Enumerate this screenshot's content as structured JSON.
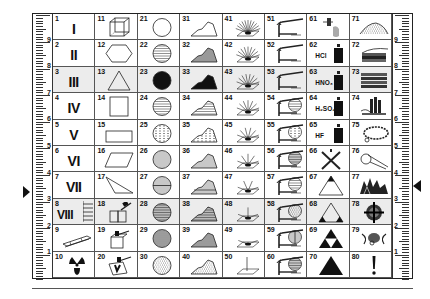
{
  "ruler": {
    "labels": [
      "9",
      "8",
      "7",
      "6",
      "5",
      "4",
      "3",
      "2",
      "1"
    ]
  },
  "cells": [
    {
      "n": "1",
      "roman": "I",
      "icon": "roman-numeral"
    },
    {
      "n": "2",
      "roman": "II",
      "icon": "roman-numeral"
    },
    {
      "n": "3",
      "roman": "III",
      "icon": "roman-numeral",
      "shade": true
    },
    {
      "n": "4",
      "roman": "IV",
      "icon": "roman-numeral"
    },
    {
      "n": "5",
      "roman": "V",
      "icon": "roman-numeral"
    },
    {
      "n": "6",
      "roman": "VI",
      "icon": "roman-numeral"
    },
    {
      "n": "7",
      "roman": "VII",
      "icon": "roman-numeral"
    },
    {
      "n": "8",
      "roman": "VIII",
      "icon": "roman-numeral-lines",
      "shade": true
    },
    {
      "n": "9",
      "icon": "ruler-bar-icon"
    },
    {
      "n": "10",
      "icon": "radiation-icon"
    },
    {
      "n": "11",
      "icon": "cube-icon"
    },
    {
      "n": "12",
      "icon": "hexagon-icon"
    },
    {
      "n": "13",
      "icon": "triangle-outline-icon",
      "shade": true
    },
    {
      "n": "14",
      "icon": "square-icon"
    },
    {
      "n": "15",
      "icon": "rectangle-icon"
    },
    {
      "n": "16",
      "icon": "parallelogram-icon"
    },
    {
      "n": "17",
      "icon": "scalene-triangle-icon"
    },
    {
      "n": "18",
      "icon": "hammer-block-icon",
      "shade": true
    },
    {
      "n": "19",
      "icon": "hammer-box-icon"
    },
    {
      "n": "20",
      "icon": "hammer-broken-box-icon"
    },
    {
      "n": "21",
      "icon": "circle-empty-icon"
    },
    {
      "n": "22",
      "icon": "circle-hlines-icon"
    },
    {
      "n": "23",
      "icon": "circle-filled-icon",
      "shade": true
    },
    {
      "n": "24",
      "icon": "circle-hlines-sparse-icon"
    },
    {
      "n": "25",
      "icon": "circle-dashed-icon"
    },
    {
      "n": "26",
      "icon": "circle-vlines-icon"
    },
    {
      "n": "27",
      "icon": "circle-vlines-split-icon"
    },
    {
      "n": "28",
      "icon": "circle-crosshatch-icon",
      "shade": true
    },
    {
      "n": "29",
      "icon": "circle-hlines-bold-icon"
    },
    {
      "n": "30",
      "icon": "circle-stipple-icon"
    },
    {
      "n": "31",
      "icon": "mountain-outline-icon"
    },
    {
      "n": "32",
      "icon": "mountain-gray-icon"
    },
    {
      "n": "33",
      "icon": "mountain-filled-icon",
      "shade": true
    },
    {
      "n": "34",
      "icon": "mountain-hlines-icon"
    },
    {
      "n": "35",
      "icon": "mountain-dashed-icon"
    },
    {
      "n": "36",
      "icon": "mountain-vlines-icon"
    },
    {
      "n": "37",
      "icon": "mountain-vlines-split-icon"
    },
    {
      "n": "38",
      "icon": "mountain-crosshatch-icon",
      "shade": true
    },
    {
      "n": "39",
      "icon": "mountain-hlines-bold-icon"
    },
    {
      "n": "40",
      "icon": "mountain-stipple-icon"
    },
    {
      "n": "41",
      "icon": "fan-rays-11-icon"
    },
    {
      "n": "42",
      "icon": "fan-rays-9-icon"
    },
    {
      "n": "43",
      "icon": "fan-rays-8-icon",
      "shade": true
    },
    {
      "n": "44",
      "icon": "fan-rays-7-icon"
    },
    {
      "n": "45",
      "icon": "fan-rays-6-icon"
    },
    {
      "n": "46",
      "icon": "fan-rays-5-icon"
    },
    {
      "n": "47",
      "icon": "fan-rays-4-icon"
    },
    {
      "n": "48",
      "icon": "fan-rays-3-icon",
      "shade": true
    },
    {
      "n": "49",
      "icon": "fan-rays-2-icon"
    },
    {
      "n": "50",
      "icon": "fan-rays-1-icon"
    },
    {
      "n": "51",
      "icon": "tap-pipe-icon"
    },
    {
      "n": "52",
      "icon": "tap-pipe-icon"
    },
    {
      "n": "53",
      "icon": "tap-pipe-icon",
      "shade": true
    },
    {
      "n": "54",
      "icon": "tap-circle-hlines-icon"
    },
    {
      "n": "55",
      "icon": "tap-circle-dashed-icon"
    },
    {
      "n": "56",
      "icon": "tap-circle-crosshatch-icon"
    },
    {
      "n": "57",
      "icon": "tap-circle-hlines-icon"
    },
    {
      "n": "58",
      "icon": "tap-circle-stipple-icon",
      "shade": true
    },
    {
      "n": "59",
      "icon": "tap-circle-vsplit-icon"
    },
    {
      "n": "60",
      "icon": "tap-circle-grid-icon"
    },
    {
      "n": "61",
      "icon": "dropper-icon"
    },
    {
      "n": "62",
      "chem": "HCl",
      "icon": "acid-bottle-icon"
    },
    {
      "n": "63",
      "chem": "HNO₃",
      "icon": "acid-bottle-icon",
      "shade": true
    },
    {
      "n": "64",
      "chem": "H₂SO₄",
      "icon": "acid-bottle-icon"
    },
    {
      "n": "65",
      "chem": "HF",
      "icon": "acid-bottle-icon"
    },
    {
      "n": "66",
      "icon": "cross-icon"
    },
    {
      "n": "67",
      "icon": "triangle-top-filled-icon"
    },
    {
      "n": "68",
      "icon": "triangle-corners-filled-icon",
      "shade": true
    },
    {
      "n": "69",
      "icon": "triangle-triforce-icon"
    },
    {
      "n": "70",
      "icon": "triangle-filled-icon"
    },
    {
      "n": "71",
      "icon": "sand-heap-icon"
    },
    {
      "n": "72",
      "icon": "layered-rock-icon"
    },
    {
      "n": "73",
      "icon": "sediment-layers-icon",
      "shade": true
    },
    {
      "n": "74",
      "icon": "crystal-columns-icon"
    },
    {
      "n": "75",
      "icon": "ring-chain-icon"
    },
    {
      "n": "76",
      "icon": "whistle-icon"
    },
    {
      "n": "77",
      "icon": "crystal-cluster-icon"
    },
    {
      "n": "78",
      "icon": "target-cross-icon",
      "shade": true
    },
    {
      "n": "79",
      "icon": "creature-icon"
    },
    {
      "n": "80",
      "icon": "exclamation-icon"
    }
  ]
}
